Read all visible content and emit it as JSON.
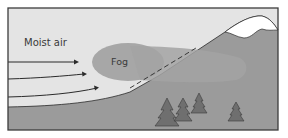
{
  "diagram": {
    "labels": {
      "moist_air": "Moist air",
      "fog": "Fog"
    },
    "elements": {
      "arrows": [
        {
          "name": "wind-arrow-1",
          "description": "horizontal moist air flow"
        },
        {
          "name": "wind-arrow-2",
          "description": "moist air flow curving upward"
        },
        {
          "name": "wind-arrow-3",
          "description": "moist air flow rising up slope"
        }
      ],
      "mountain": {
        "snow_cap": true
      },
      "trees": 4,
      "condensation_line": "dashed"
    },
    "colors": {
      "sky": "#e4e4e4",
      "ground": "#9b9b9b",
      "fog": "#a7a7a7",
      "fog_over_mountain": "#a2a2a2",
      "snow": "#ffffff",
      "tree": "#6f6f6f",
      "outline": "#2b2b2b",
      "frame": "#3c3c3c"
    }
  }
}
